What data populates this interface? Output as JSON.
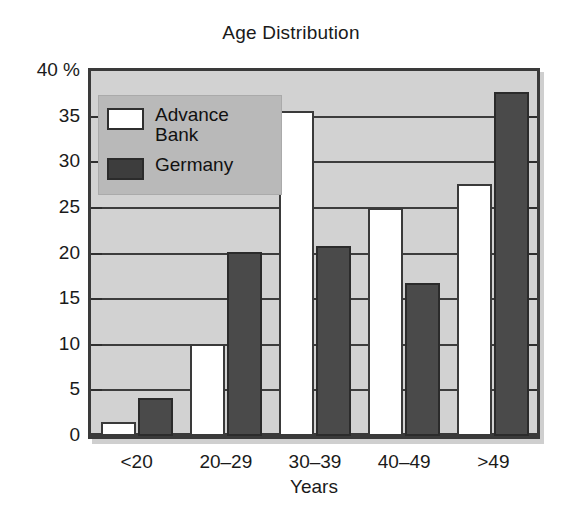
{
  "chart_data": {
    "type": "bar",
    "title": "Age Distribution",
    "xlabel": "Years",
    "ylabel": "",
    "y_unit": "%",
    "categories": [
      "<20",
      "20–29",
      "30–39",
      "40–49",
      ">49"
    ],
    "series": [
      {
        "name": "Advance Bank",
        "color": "#ffffff",
        "values": [
          1.5,
          10.1,
          35.6,
          25.0,
          27.6
        ]
      },
      {
        "name": "Germany",
        "color": "#4a4a4a",
        "values": [
          4.2,
          20.2,
          20.8,
          16.8,
          37.7
        ]
      }
    ],
    "ylim": [
      0,
      40
    ],
    "yticks": [
      0,
      5,
      10,
      15,
      20,
      25,
      30,
      35,
      40
    ],
    "ytick_labels": [
      "0",
      "5",
      "10",
      "15",
      "20",
      "25",
      "30",
      "35",
      "40 %"
    ],
    "grid": true,
    "legend_position": "top-left",
    "plot_background": "#d2d2d2",
    "axis_color": "#3a3a3a"
  },
  "legend": {
    "entries": [
      {
        "label": "Advance\nBank",
        "swatch": "light"
      },
      {
        "label": "Germany",
        "swatch": "dark"
      }
    ]
  }
}
